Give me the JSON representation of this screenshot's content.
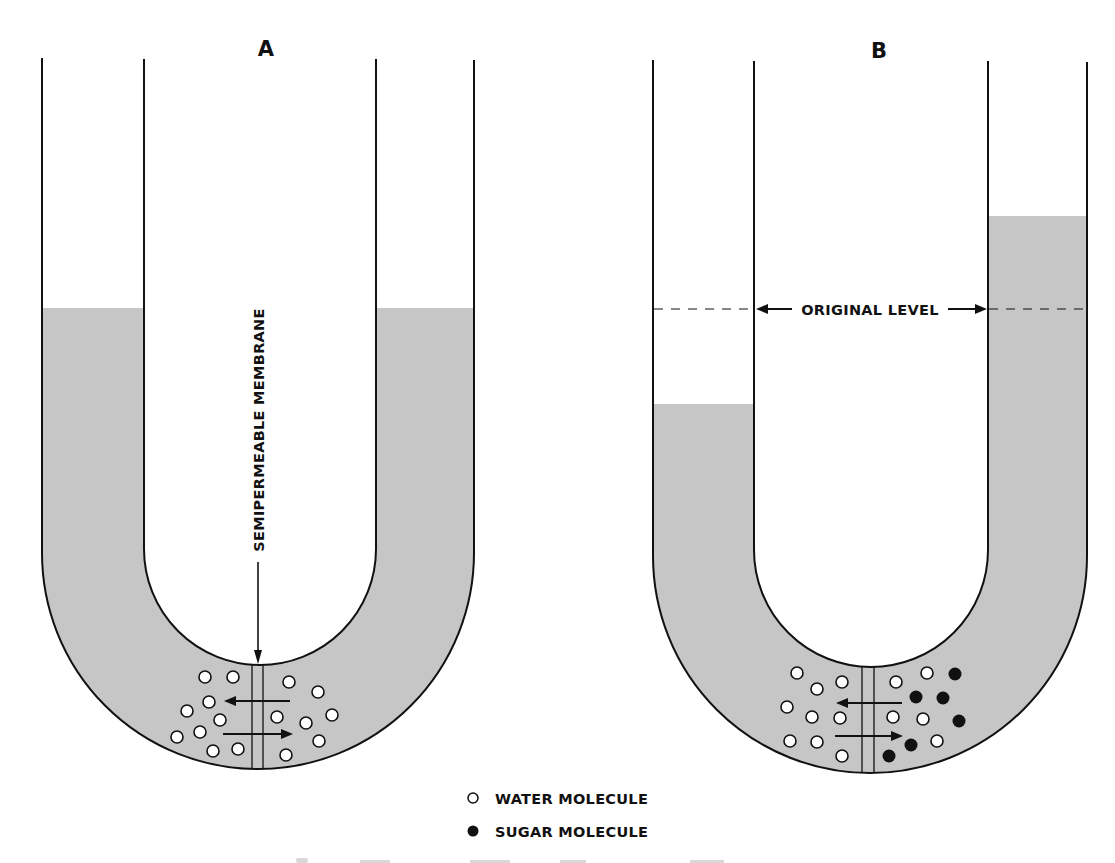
{
  "figure": {
    "panels": [
      {
        "id": "A",
        "label": "A",
        "description": "U-tube with equal liquid levels on both sides of a semipermeable membrane",
        "membrane_label": "SEMIPERMEABLE MEMBRANE",
        "left_level_y": 308,
        "right_level_y": 308,
        "left_side_molecules": {
          "water": 9,
          "sugar": 0
        },
        "right_side_molecules": {
          "water": 7,
          "sugar": 0
        },
        "flow_arrows": [
          "left",
          "right"
        ]
      },
      {
        "id": "B",
        "label": "B",
        "description": "U-tube after osmosis: level falls on water side, rises on sugar side",
        "level_marker_label": "ORIGINAL LEVEL",
        "left_level_y": 404,
        "right_level_y": 216,
        "original_level_y": 309,
        "left_side_molecules": {
          "water": 9,
          "sugar": 0
        },
        "right_side_molecules": {
          "water": 5,
          "sugar": 6
        },
        "flow_arrows": [
          "left",
          "right"
        ]
      }
    ],
    "legend": [
      {
        "symbol": "open-circle",
        "label": "WATER MOLECULE"
      },
      {
        "symbol": "filled-circle",
        "label": "SUGAR MOLECULE"
      }
    ],
    "colors": {
      "liquid": "#c6c6c6",
      "outline": "#111111",
      "background": "#ffffff"
    }
  }
}
